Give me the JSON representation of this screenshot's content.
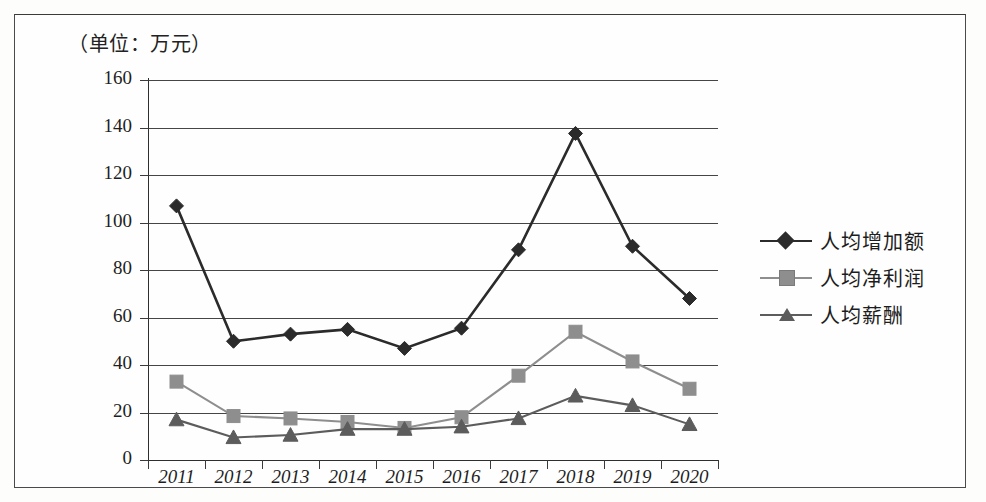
{
  "unit_title": "（单位：万元）",
  "legend": {
    "position": "right",
    "items": [
      {
        "label": "人均增加额",
        "marker": "diamond",
        "color": "#2b2b2b"
      },
      {
        "label": "人均净利润",
        "marker": "square",
        "color": "#8e8e8e"
      },
      {
        "label": "人均薪酬",
        "marker": "triangle",
        "color": "#5c5c5c"
      }
    ]
  },
  "axis": {
    "y_ticks": [
      "160",
      "140",
      "120",
      "100",
      "80",
      "60",
      "40",
      "20",
      "0"
    ],
    "x_ticks": [
      "2011",
      "2012",
      "2013",
      "2014",
      "2015",
      "2016",
      "2017",
      "2018",
      "2019",
      "2020"
    ]
  },
  "chart_data": {
    "type": "line",
    "title": "（单位：万元）",
    "xlabel": "",
    "ylabel": "",
    "unit": "万元",
    "grid": true,
    "legend_position": "right",
    "ylim": [
      0,
      160
    ],
    "ytick_step": 20,
    "categories": [
      "2011",
      "2012",
      "2013",
      "2014",
      "2015",
      "2016",
      "2017",
      "2018",
      "2019",
      "2020"
    ],
    "series": [
      {
        "name": "人均增加额",
        "marker": "diamond",
        "color": "#2b2b2b",
        "values": [
          107,
          50,
          53,
          55,
          47,
          55.5,
          88.5,
          137.5,
          90,
          68
        ]
      },
      {
        "name": "人均净利润",
        "marker": "square",
        "color": "#8e8e8e",
        "values": [
          33,
          18.5,
          17.5,
          16,
          13.5,
          18,
          35.5,
          54,
          41.5,
          30
        ]
      },
      {
        "name": "人均薪酬",
        "marker": "triangle",
        "color": "#5c5c5c",
        "values": [
          17,
          9.5,
          10.5,
          13,
          13,
          14,
          17.5,
          27,
          23,
          15
        ]
      }
    ]
  }
}
